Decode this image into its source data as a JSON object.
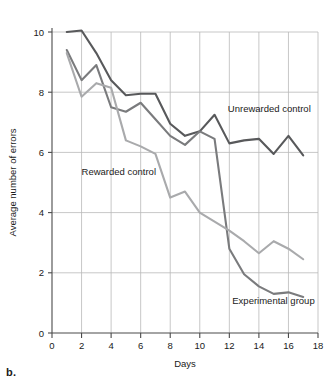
{
  "figure": {
    "panel_caption": "b."
  },
  "chart_data": {
    "type": "line",
    "title": "",
    "xlabel": "Days",
    "ylabel": "Average number of errors",
    "xlim": [
      0,
      18
    ],
    "ylim": [
      0,
      10
    ],
    "xticks": [
      0,
      2,
      4,
      6,
      8,
      10,
      12,
      14,
      16,
      18
    ],
    "yticks": [
      0,
      2,
      4,
      6,
      8,
      10
    ],
    "xtick_labels": [
      "0",
      "2",
      "4",
      "6",
      "8",
      "10",
      "12",
      "14",
      "16",
      "18"
    ],
    "ytick_labels": [
      "0",
      "2",
      "4",
      "6",
      "8",
      "10"
    ],
    "grid": true,
    "legend": "inline-annotations",
    "x": [
      1,
      2,
      3,
      4,
      5,
      6,
      7,
      8,
      9,
      10,
      11,
      12,
      13,
      14,
      15,
      16,
      17
    ],
    "series": [
      {
        "name": "Unrewarded control",
        "color": "#58595b",
        "values": [
          10.0,
          10.05,
          9.3,
          8.4,
          7.9,
          7.95,
          7.95,
          6.95,
          6.55,
          6.7,
          7.25,
          6.3,
          6.4,
          6.45,
          5.95,
          6.55,
          5.9
        ],
        "label_x": 11.9,
        "label_y": 7.35
      },
      {
        "name": "Experimental group",
        "color": "#7a7b7d",
        "values": [
          9.4,
          8.4,
          8.9,
          7.5,
          7.35,
          7.65,
          7.1,
          6.55,
          6.25,
          6.7,
          6.45,
          2.8,
          1.95,
          1.55,
          1.3,
          1.35,
          1.2
        ],
        "label_x": 12.2,
        "label_y": 0.95
      },
      {
        "name": "Rewarded control",
        "color": "#a9aaac",
        "values": [
          9.3,
          7.85,
          8.3,
          8.15,
          6.4,
          6.2,
          5.95,
          4.5,
          4.7,
          4.0,
          3.7,
          3.4,
          3.05,
          2.65,
          3.05,
          2.8,
          2.45
        ],
        "label_x": 2.0,
        "label_y": 5.25
      }
    ]
  }
}
